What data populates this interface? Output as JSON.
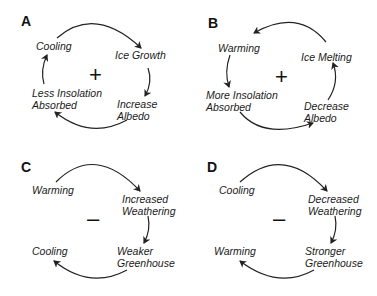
{
  "panels": [
    {
      "label": "A",
      "sign": "+",
      "nodes": [
        "Cooling",
        "Ice Growth",
        "Increase",
        "Albedo",
        "Less Insolation",
        "Absorbed"
      ]
    },
    {
      "label": "B",
      "sign": "+",
      "nodes": [
        "Warming",
        "Ice Melting",
        "Decrease",
        "Albedo",
        "More Insolation",
        "Absorbed"
      ]
    },
    {
      "label": "C",
      "sign": "–",
      "nodes": [
        "Warming",
        "Increased",
        "Weathering",
        "Weaker",
        "Greenhouse",
        "Cooling"
      ]
    },
    {
      "label": "D",
      "sign": "–",
      "nodes": [
        "Cooling",
        "Decreased",
        "Weathering",
        "Stronger",
        "Greenhouse",
        "Warming"
      ]
    }
  ]
}
